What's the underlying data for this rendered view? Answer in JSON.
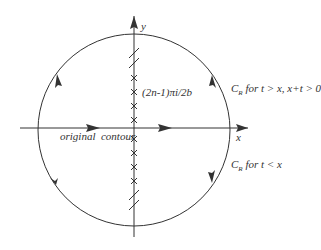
{
  "diagram": {
    "axis_labels": {
      "x": "x",
      "y": "y"
    },
    "poles_label": "(2n-1)πi/2b",
    "original_contour_label": "original  contour",
    "upper_contour_label": {
      "main": "C",
      "sub": "R",
      "rest": " for t > x, x+t > 0"
    },
    "lower_contour_label": {
      "main": "C",
      "sub": "R",
      "rest": " for t < x"
    },
    "colors": {
      "stroke": "#333333",
      "background": "#ffffff"
    },
    "pole_count_upper": 4,
    "pole_count_lower": 4
  }
}
